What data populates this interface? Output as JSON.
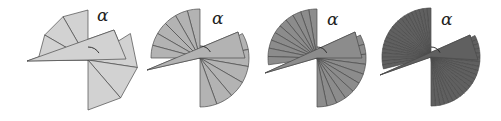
{
  "diagram": {
    "title": "",
    "angle_label": "α",
    "stroke_color": "#4a4a4a",
    "figures": [
      {
        "id": "fig-1",
        "fill": "#d2d2d2",
        "center": [
          88,
          60
        ],
        "radius": 50,
        "upper_fan": {
          "start_deg": 90,
          "end_deg": 180,
          "slices": 3
        },
        "lower_fan": {
          "start_deg": 32,
          "end_deg": -90,
          "slices": 3
        },
        "long_sector": {
          "left_point": [
            27,
            61
          ],
          "right_top": [
            114,
            30
          ],
          "right_point": [
            126,
            59
          ]
        },
        "alpha_pos": [
          97,
          21
        ],
        "arc": {
          "r": 13,
          "from_deg": 90,
          "to_deg": 32
        }
      },
      {
        "id": "fig-2",
        "fill": "#b3b3b3",
        "center": [
          200,
          58
        ],
        "radius": 49,
        "upper_fan": {
          "start_deg": 90,
          "end_deg": 180,
          "slices": 6
        },
        "lower_fan": {
          "start_deg": 30,
          "end_deg": -90,
          "slices": 6
        },
        "long_sector": {
          "left_point": [
            147,
            70
          ],
          "right_top": [
            238,
            32
          ],
          "right_point": [
            245,
            58
          ]
        },
        "alpha_pos": [
          212,
          24
        ],
        "arc": {
          "r": 12,
          "from_deg": 90,
          "to_deg": 30
        }
      },
      {
        "id": "fig-3",
        "fill": "#8c8c8c",
        "center": [
          317,
          58
        ],
        "radius": 49,
        "upper_fan": {
          "start_deg": 90,
          "end_deg": 188,
          "slices": 10
        },
        "lower_fan": {
          "start_deg": 28,
          "end_deg": -90,
          "slices": 10
        },
        "long_sector": {
          "left_point": [
            265,
            73
          ],
          "right_top": [
            355,
            32
          ],
          "right_point": [
            362,
            58
          ]
        },
        "alpha_pos": [
          327,
          25
        ],
        "arc": {
          "r": 11,
          "from_deg": 90,
          "to_deg": 28
        }
      },
      {
        "id": "fig-4",
        "fill": "#606060",
        "center": [
          431,
          57
        ],
        "radius": 49,
        "upper_fan": {
          "start_deg": 90,
          "end_deg": 194,
          "slices": 22
        },
        "lower_fan": {
          "start_deg": 26,
          "end_deg": -90,
          "slices": 22
        },
        "long_sector": {
          "left_point": [
            380,
            75
          ],
          "right_top": [
            470,
            35
          ],
          "right_point": [
            478,
            60
          ]
        },
        "alpha_pos": [
          441,
          25
        ],
        "arc": {
          "r": 10,
          "from_deg": 90,
          "to_deg": 26
        }
      }
    ]
  }
}
